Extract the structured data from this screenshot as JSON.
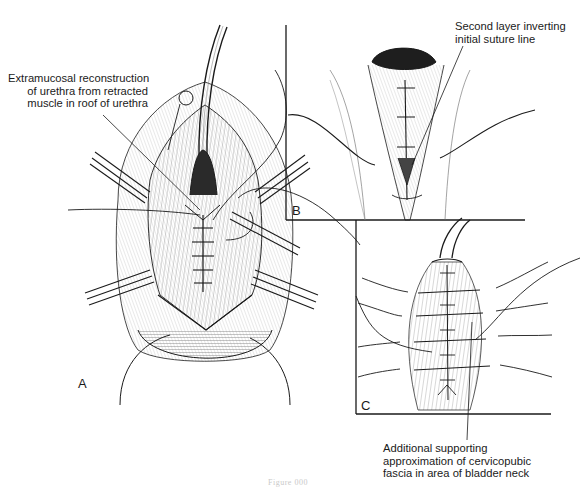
{
  "figure": {
    "type": "surgical illustration",
    "panels": [
      {
        "id": "A",
        "letter": "A"
      },
      {
        "id": "B",
        "letter": "B"
      },
      {
        "id": "C",
        "letter": "C"
      }
    ],
    "annotations": {
      "extramucosal": {
        "lines": [
          "Extramucosal reconstruction",
          "of urethra from retracted",
          "muscle in roof of urethra"
        ]
      },
      "second_layer": {
        "lines": [
          "Second layer inverting",
          "initial suture line"
        ]
      },
      "additional_support": {
        "lines": [
          "Additional supporting",
          "approximation of cervicopubic",
          "fascia in area of bladder neck"
        ]
      }
    },
    "caption": "Figure 000",
    "colors": {
      "ink": "#1a1a1a",
      "background": "#ffffff",
      "hatch": "#6a6a6a",
      "caption": "#c9c9c9"
    }
  }
}
